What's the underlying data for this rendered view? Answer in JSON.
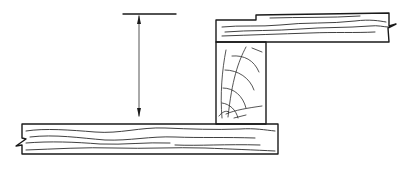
{
  "diagram": {
    "type": "technical-line-drawing",
    "stroke_color": "#1a1a1a",
    "background": "#ffffff",
    "elements": [
      {
        "id": "dimension-arrow",
        "kind": "vertical double-headed arrow",
        "x": 139,
        "y_top": 15,
        "y_bottom": 117
      },
      {
        "id": "dimension-reference-line",
        "kind": "horizontal line",
        "x1": 123,
        "x2": 176,
        "y": 14
      },
      {
        "id": "lower-board",
        "kind": "board with long grain and left break",
        "x1": 22,
        "x2": 278,
        "y1": 124,
        "y2": 154
      },
      {
        "id": "upper-board",
        "kind": "board with long grain and right break",
        "x1": 216,
        "x2": 389,
        "y1": 13,
        "y2": 42
      },
      {
        "id": "end-grain-block",
        "kind": "block showing end grain rings",
        "x1": 216,
        "x2": 266,
        "y1": 42,
        "y2": 123
      }
    ],
    "labels": []
  }
}
